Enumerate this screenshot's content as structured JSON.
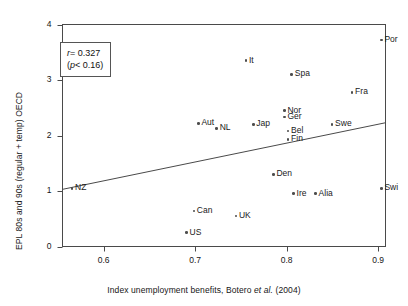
{
  "chart_data": {
    "type": "scatter",
    "title": "",
    "xlabel": "Index unemployment benefits, Botero et al. (2004)",
    "ylabel": "EPL 80s and 90s (regular + temp) OECD",
    "xlim": [
      0.555,
      0.908
    ],
    "ylim": [
      0,
      4.0
    ],
    "xticks": [
      0.6,
      0.7,
      0.8,
      0.9
    ],
    "xtick_labels": [
      "0.6",
      "0.7",
      "0.8",
      "0.9"
    ],
    "yticks": [
      0,
      1,
      2,
      3,
      4
    ],
    "ytick_labels": [
      "0",
      "1",
      "2",
      "3",
      "4"
    ],
    "grid": false,
    "legend": null,
    "points": [
      {
        "label": "NZ",
        "x": 0.5655,
        "y": 1.05,
        "label_pos": "right"
      },
      {
        "label": "US",
        "x": 0.6905,
        "y": 0.25,
        "label_pos": "right"
      },
      {
        "label": "Can",
        "x": 0.6985,
        "y": 0.64,
        "label_pos": "right"
      },
      {
        "label": "Aut",
        "x": 0.7035,
        "y": 2.22,
        "label_pos": "right"
      },
      {
        "label": "NL",
        "x": 0.7235,
        "y": 2.13,
        "label_pos": "right"
      },
      {
        "label": "UK",
        "x": 0.7445,
        "y": 0.55,
        "label_pos": "right"
      },
      {
        "label": "It",
        "x": 0.7555,
        "y": 3.35,
        "label_pos": "right"
      },
      {
        "label": "Jap",
        "x": 0.7635,
        "y": 2.2,
        "label_pos": "right"
      },
      {
        "label": "Den",
        "x": 0.7855,
        "y": 1.3,
        "label_pos": "right"
      },
      {
        "label": "Nor",
        "x": 0.7975,
        "y": 2.45,
        "label_pos": "right"
      },
      {
        "label": "Ger",
        "x": 0.7975,
        "y": 2.33,
        "label_pos": "right"
      },
      {
        "label": "Bel",
        "x": 0.8015,
        "y": 2.08,
        "label_pos": "right"
      },
      {
        "label": "Fin",
        "x": 0.8015,
        "y": 1.93,
        "label_pos": "right"
      },
      {
        "label": "Spa",
        "x": 0.8055,
        "y": 3.1,
        "label_pos": "right"
      },
      {
        "label": "Ire",
        "x": 0.8075,
        "y": 0.95,
        "label_pos": "right"
      },
      {
        "label": "Alia",
        "x": 0.8315,
        "y": 0.95,
        "label_pos": "right"
      },
      {
        "label": "Swe",
        "x": 0.8495,
        "y": 2.2,
        "label_pos": "right"
      },
      {
        "label": "Fra",
        "x": 0.8715,
        "y": 2.78,
        "label_pos": "right"
      },
      {
        "label": "Por",
        "x": 0.9035,
        "y": 3.72,
        "label_pos": "right"
      },
      {
        "label": "Swi",
        "x": 0.9035,
        "y": 1.05,
        "label_pos": "right"
      }
    ],
    "trend_line": {
      "x_start": 0.555,
      "y_start": 1.03,
      "x_end": 0.908,
      "y_end": 2.23
    },
    "annotation": {
      "r_prefix": "r",
      "r_text": "= 0.327",
      "p_prefix": "p",
      "p_text": "< 0.16)",
      "p_open": "(",
      "r_value": 0.327,
      "p_value": 0.16
    }
  },
  "figure": {
    "xlabel_main": "Index unemployment benefits, Botero ",
    "xlabel_italic": "et al.",
    "xlabel_tail": " (2004)",
    "ylabel": "EPL 80s and 90s (regular + temp) OECD"
  }
}
